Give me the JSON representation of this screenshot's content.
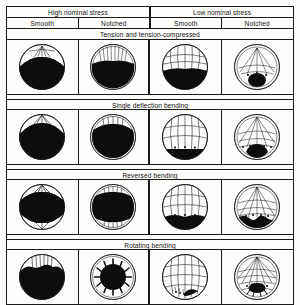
{
  "figure": {
    "kind": "fatigue-fracture-surface-chart",
    "ink_color": "#141414",
    "paper_color": "#fdfdfb",
    "fracture_fill": "#0d0d0d"
  },
  "header": {
    "groups": [
      {
        "label": "High nominal stress"
      },
      {
        "label": "Low nominal stress"
      }
    ],
    "subcolumns": [
      {
        "label": "Smooth"
      },
      {
        "label": "Notched"
      },
      {
        "label": "Smooth"
      },
      {
        "label": "Notched"
      }
    ]
  },
  "sections": [
    {
      "label": "Tension and tension-compressed",
      "cells": [
        {
          "name": "high-smooth",
          "variant": "v1"
        },
        {
          "name": "high-notched",
          "variant": "v2"
        },
        {
          "name": "low-smooth",
          "variant": "v3"
        },
        {
          "name": "low-notched",
          "variant": "v4"
        }
      ]
    },
    {
      "label": "Single deflection bending",
      "cells": [
        {
          "name": "high-smooth",
          "variant": "v5"
        },
        {
          "name": "high-notched",
          "variant": "v6"
        },
        {
          "name": "low-smooth",
          "variant": "v7"
        },
        {
          "name": "low-notched",
          "variant": "v8"
        }
      ]
    },
    {
      "label": "Reversed bending",
      "cells": [
        {
          "name": "high-smooth",
          "variant": "v9"
        },
        {
          "name": "high-notched",
          "variant": "v10"
        },
        {
          "name": "low-smooth",
          "variant": "v11"
        },
        {
          "name": "low-notched",
          "variant": "v12"
        }
      ]
    },
    {
      "label": "Rotating bending",
      "cells": [
        {
          "name": "high-smooth",
          "variant": "v13"
        },
        {
          "name": "high-notched",
          "variant": "v14"
        },
        {
          "name": "low-smooth",
          "variant": "v15"
        },
        {
          "name": "low-notched",
          "variant": "v16"
        }
      ]
    }
  ]
}
